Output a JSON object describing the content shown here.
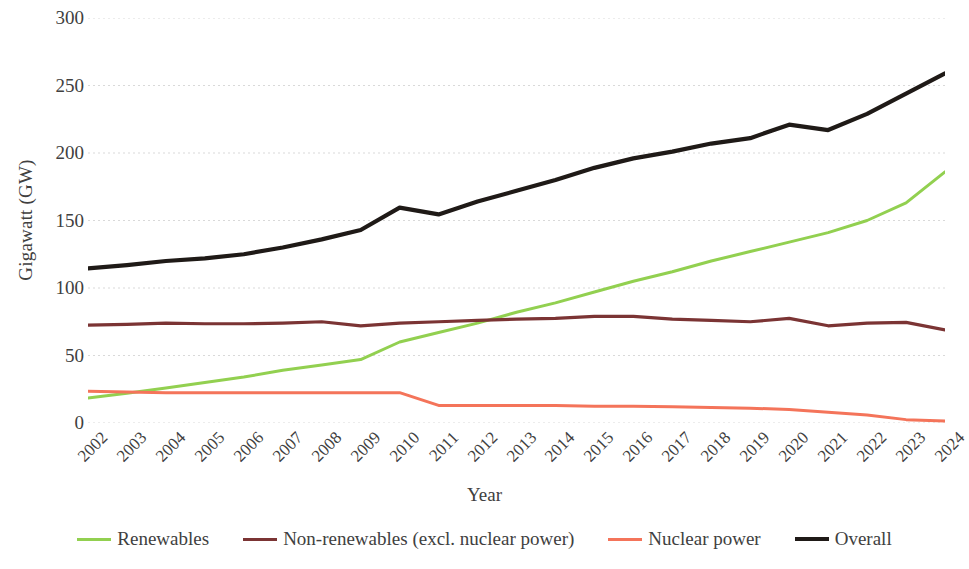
{
  "chart_data": {
    "type": "line",
    "title": "",
    "xlabel": "Year",
    "ylabel": "Gigawatt (GW)",
    "x": [
      2002,
      2003,
      2004,
      2005,
      2006,
      2007,
      2008,
      2009,
      2010,
      2011,
      2012,
      2013,
      2014,
      2015,
      2016,
      2017,
      2018,
      2019,
      2020,
      2021,
      2022,
      2023,
      2024
    ],
    "xticklabels": [
      "2002",
      "2003",
      "2004",
      "2005",
      "2006",
      "2007",
      "2008",
      "2009",
      "2010",
      "2011",
      "2012",
      "2013",
      "2014",
      "2015",
      "2016",
      "2017",
      "2018",
      "2019",
      "2020",
      "2021",
      "2022",
      "2023",
      "2024"
    ],
    "yticklabels": [
      "0",
      "50",
      "100",
      "150",
      "200",
      "250",
      "300"
    ],
    "yticks": [
      0,
      50,
      100,
      150,
      200,
      250,
      300
    ],
    "ylim": [
      0,
      300
    ],
    "grid": "horizontal-dashed",
    "legend_position": "bottom",
    "series": [
      {
        "name": "Renewables",
        "color": "#92D050",
        "width": 3,
        "values": [
          18.5,
          22,
          26,
          30,
          34,
          39,
          43,
          47,
          60,
          67,
          74,
          82,
          89,
          97,
          105,
          112,
          120,
          127,
          134,
          141,
          150,
          163,
          186
        ]
      },
      {
        "name": "Non-renewables (excl. nuclear power)",
        "color": "#7B3434",
        "width": 3.2,
        "values": [
          72.5,
          73,
          74,
          73.5,
          73.5,
          74,
          75,
          72,
          74,
          75,
          76,
          77,
          77.5,
          79,
          79,
          77,
          76,
          75,
          77.5,
          72,
          74,
          74.5,
          69
        ]
      },
      {
        "name": "Nuclear power",
        "color": "#F4745A",
        "width": 3,
        "values": [
          23.5,
          23,
          22.5,
          22.5,
          22.5,
          22.5,
          22.5,
          22.5,
          22.5,
          13,
          13,
          13,
          13,
          12.5,
          12.5,
          12,
          11.5,
          11,
          10,
          8,
          6,
          2.5,
          1.5
        ]
      },
      {
        "name": "Overall",
        "color": "#1F1A17",
        "width": 4.2,
        "values": [
          114.5,
          117,
          120,
          122,
          125,
          130,
          136,
          143,
          159.5,
          154.5,
          164,
          172,
          180,
          189,
          196,
          201,
          207,
          211,
          221,
          217,
          229,
          244,
          259
        ]
      }
    ]
  },
  "axes": {
    "y_title": "Gigawatt (GW)",
    "x_title": "Year"
  },
  "legend": {
    "items": [
      {
        "label": "Renewables",
        "color": "#92D050"
      },
      {
        "label": "Non-renewables (excl. nuclear power)",
        "color": "#7B3434"
      },
      {
        "label": "Nuclear power",
        "color": "#F4745A"
      },
      {
        "label": "Overall",
        "color": "#1F1A17"
      }
    ]
  }
}
